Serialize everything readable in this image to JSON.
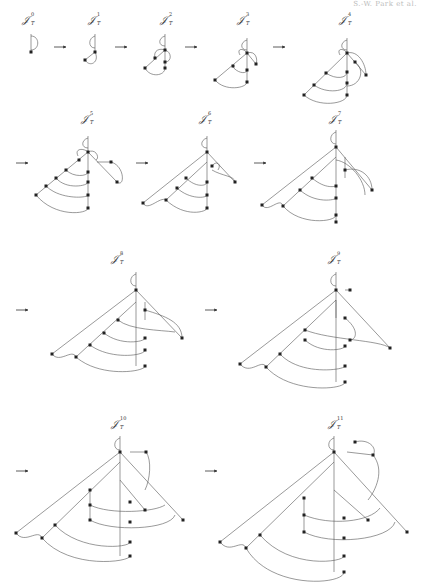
{
  "header": {
    "running_head": "S.-W. Park et al."
  },
  "figure": {
    "label_base": "𝒥",
    "label_sub": "T",
    "panels": [
      {
        "id": 0,
        "sup": "0",
        "row": 1
      },
      {
        "id": 1,
        "sup": "1",
        "row": 1
      },
      {
        "id": 2,
        "sup": "2",
        "row": 1
      },
      {
        "id": 3,
        "sup": "3",
        "row": 1
      },
      {
        "id": 4,
        "sup": "4",
        "row": 1
      },
      {
        "id": 5,
        "sup": "5",
        "row": 2
      },
      {
        "id": 6,
        "sup": "6",
        "row": 2
      },
      {
        "id": 7,
        "sup": "7",
        "row": 2
      },
      {
        "id": 8,
        "sup": "8",
        "row": 3
      },
      {
        "id": 9,
        "sup": "9",
        "row": 3
      },
      {
        "id": 10,
        "sup": "10",
        "row": 4
      },
      {
        "id": 11,
        "sup": "11",
        "row": 4
      }
    ],
    "arrow_glyph": "→",
    "colors": {
      "node": "#222222",
      "edge": "#555555",
      "background": "#ffffff"
    }
  }
}
